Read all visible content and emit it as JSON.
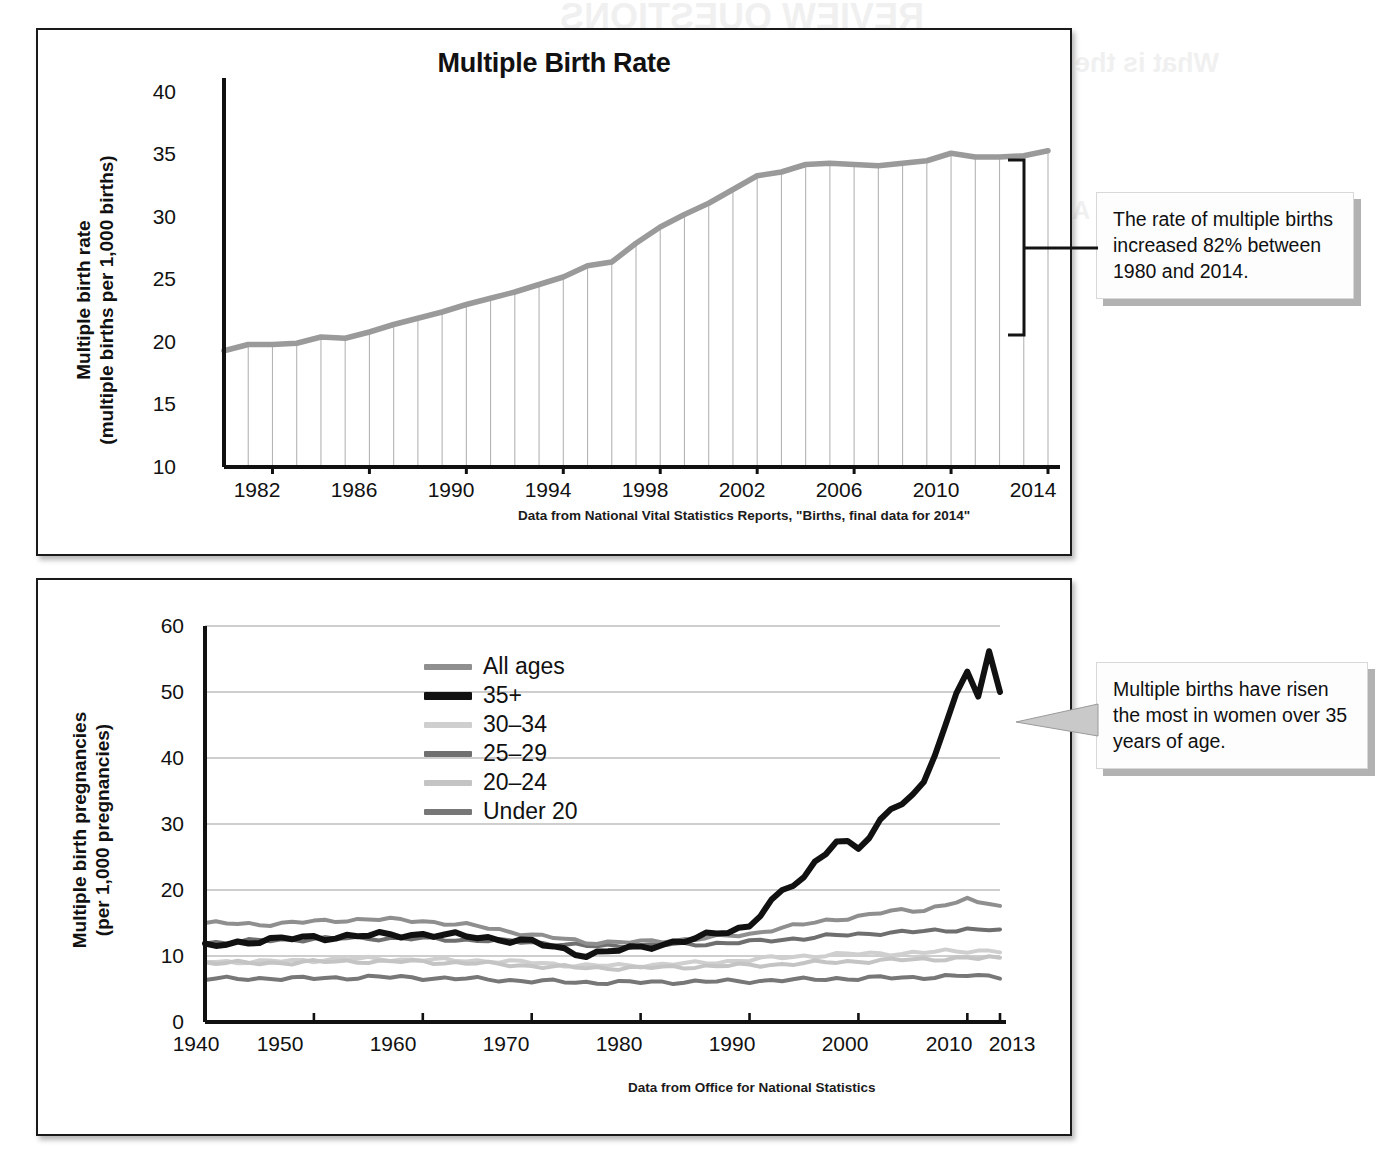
{
  "page": {
    "background_color": "#ffffff",
    "bleed_text": [
      "REVIEW QUESTIONS",
      "What is the multiple birth rate, and how does the introductory",
      "What is the male and female gamete called,",
      "case discuss the reproductive system?",
      "At what age levels are most significant in reproduction",
      "Multiple births are less common in reproduction",
      "How are the hormones of the female reproductive",
      "interactions regulated by physiological changes"
    ]
  },
  "charts": [
    {
      "id": "multiple-birth-rate",
      "title": "Multiple Birth Rate",
      "ylabel_line1": "Multiple birth rate",
      "ylabel_line2": "(multiple births per 1,000 births)",
      "source": "Data from National Vital Statistics Reports, \"Births, final data for 2014\"",
      "callout": "The rate of multiple births increased 82% between 1980 and 2014.",
      "line_color": "#9a9a9a",
      "dropline_color": "#b4b4b4"
    },
    {
      "id": "multiple-birth-pregnancies",
      "ylabel_line1": "Multiple birth pregnancies",
      "ylabel_line2": "(per 1,000 pregnancies)",
      "source": "Data from Office for National Statistics",
      "callout": "Multiple births have risen the most in women over 35 years of age.",
      "grid_color": "#9d9d9d"
    }
  ],
  "chart_data": [
    {
      "type": "line",
      "title": "Multiple Birth Rate",
      "xlabel": "",
      "ylabel": "Multiple birth rate (multiple births per 1,000 births)",
      "xlim": [
        1980,
        2014
      ],
      "ylim": [
        10,
        40
      ],
      "yticks": [
        10,
        15,
        20,
        25,
        30,
        35,
        40
      ],
      "xticks": [
        1982,
        1986,
        1990,
        1994,
        1998,
        2002,
        2006,
        2010,
        2014
      ],
      "grid": "vertical droplines at every year",
      "legend": "none",
      "annotation": "The rate of multiple births increased 82% between 1980 and 2014.",
      "source": "Data from National Vital Statistics Reports, \"Births, final data for 2014\"",
      "x": [
        1980,
        1981,
        1982,
        1983,
        1984,
        1985,
        1986,
        1987,
        1988,
        1989,
        1990,
        1991,
        1992,
        1993,
        1994,
        1995,
        1996,
        1997,
        1998,
        1999,
        2000,
        2001,
        2002,
        2003,
        2004,
        2005,
        2006,
        2007,
        2008,
        2009,
        2010,
        2011,
        2012,
        2013,
        2014
      ],
      "values": [
        19.3,
        19.8,
        19.8,
        19.9,
        20.4,
        20.3,
        20.8,
        21.4,
        21.9,
        22.4,
        23.0,
        23.5,
        24.0,
        24.6,
        25.2,
        26.1,
        26.4,
        27.9,
        29.2,
        30.2,
        31.1,
        32.2,
        33.3,
        33.6,
        34.2,
        34.3,
        34.2,
        34.1,
        34.3,
        34.5,
        35.1,
        34.8,
        34.8,
        34.9,
        35.3
      ],
      "units": "multiple births per 1,000 births"
    },
    {
      "type": "line",
      "title": "",
      "xlabel": "",
      "ylabel": "Multiple birth pregnancies (per 1,000 pregnancies)",
      "xlim": [
        1940,
        2013
      ],
      "ylim": [
        0,
        60
      ],
      "yticks": [
        0,
        10,
        20,
        30,
        40,
        50,
        60
      ],
      "xticks": [
        1940,
        1950,
        1960,
        1970,
        1980,
        1990,
        2000,
        2010,
        2013
      ],
      "grid": "horizontal",
      "legend_position": "upper left inside plot",
      "annotation": "Multiple births have risen the most in women over 35 years of age.",
      "source": "Data from Office for National Statistics",
      "x": [
        1940,
        1945,
        1950,
        1955,
        1960,
        1965,
        1970,
        1975,
        1980,
        1985,
        1990,
        1992,
        1995,
        1998,
        2000,
        2002,
        2004,
        2006,
        2008,
        2010,
        2011,
        2012,
        2013
      ],
      "series": [
        {
          "name": "All ages",
          "color": "#8f8f8f",
          "width": 4,
          "values": [
            15.0,
            14.8,
            15.2,
            15.6,
            15.3,
            14.5,
            13.2,
            12.1,
            12.1,
            12.6,
            13.3,
            14.0,
            14.8,
            15.6,
            16.0,
            16.5,
            16.9,
            17.0,
            17.8,
            18.5,
            18.0,
            18.1,
            17.6
          ]
        },
        {
          "name": "35+",
          "color": "#111111",
          "width": 6,
          "values": [
            11.4,
            12.4,
            12.8,
            13.1,
            13.3,
            12.9,
            12.1,
            10.2,
            11.3,
            12.6,
            14.6,
            18.3,
            22.0,
            28.0,
            25.9,
            30.2,
            33.8,
            36.0,
            45.0,
            53.0,
            50.0,
            56.2,
            50.0
          ]
        },
        {
          "name": "30–34",
          "color": "#cfcfcf",
          "width": 4,
          "values": [
            9.2,
            9.1,
            9.4,
            9.6,
            9.4,
            9.3,
            9.0,
            8.5,
            8.6,
            8.9,
            9.4,
            9.7,
            10.0,
            10.2,
            10.3,
            10.4,
            10.4,
            10.5,
            10.7,
            10.8,
            10.8,
            10.8,
            10.7
          ]
        },
        {
          "name": "25–29",
          "color": "#6f6f6f",
          "width": 4,
          "values": [
            12.0,
            12.3,
            12.6,
            12.7,
            12.6,
            12.4,
            12.1,
            11.5,
            11.6,
            11.8,
            12.1,
            12.4,
            12.7,
            13.1,
            13.3,
            13.5,
            13.6,
            13.7,
            13.9,
            14.1,
            14.0,
            14.0,
            13.8
          ]
        },
        {
          "name": "20–24",
          "color": "#c4c4c4",
          "width": 4,
          "values": [
            9.0,
            8.9,
            9.1,
            9.2,
            9.1,
            8.9,
            8.5,
            8.2,
            8.2,
            8.4,
            8.6,
            8.7,
            8.9,
            9.1,
            9.2,
            9.3,
            9.4,
            9.5,
            9.6,
            9.7,
            9.6,
            9.7,
            9.6
          ]
        },
        {
          "name": "Under 20",
          "color": "#777777",
          "width": 4,
          "values": [
            6.5,
            6.6,
            6.6,
            6.8,
            6.7,
            6.5,
            6.2,
            6.0,
            6.0,
            6.1,
            6.2,
            6.3,
            6.4,
            6.6,
            6.6,
            6.7,
            6.7,
            6.8,
            6.9,
            7.0,
            6.9,
            7.0,
            6.9
          ]
        }
      ],
      "units": "per 1,000 pregnancies"
    }
  ]
}
